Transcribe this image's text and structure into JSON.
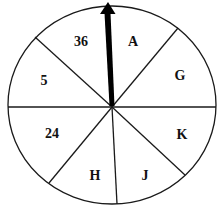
{
  "spinner": {
    "sections": [
      {
        "label": "36",
        "x": 81,
        "y": 46
      },
      {
        "label": "A",
        "x": 133,
        "y": 46
      },
      {
        "label": "G",
        "x": 180,
        "y": 80
      },
      {
        "label": "K",
        "x": 182,
        "y": 139
      },
      {
        "label": "J",
        "x": 145,
        "y": 180
      },
      {
        "label": "H",
        "x": 95,
        "y": 180
      },
      {
        "label": "24",
        "x": 52,
        "y": 138
      },
      {
        "label": "5",
        "x": 44,
        "y": 85
      }
    ],
    "section_count": 8,
    "pointer_direction": "up",
    "colors": {
      "background": "#ffffff",
      "lines": "#1a1a1a",
      "pointer": "#000000",
      "text": "#111111"
    }
  }
}
